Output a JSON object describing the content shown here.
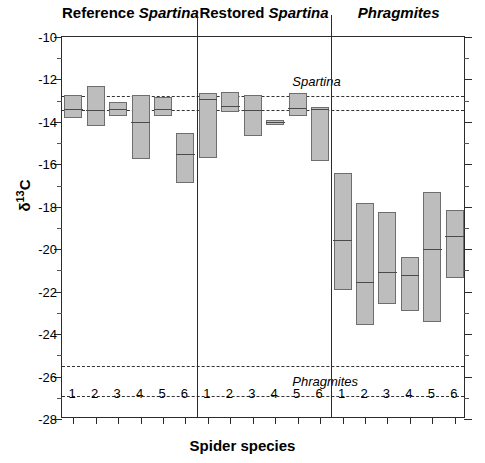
{
  "chart_data": {
    "type": "bar",
    "title": "",
    "xlabel": "Spider species",
    "ylabel_main": "δ13C",
    "ylabel_delta": "δ",
    "ylabel_sup": "13",
    "ylabel_element": "C",
    "ylim": [
      -28,
      -10
    ],
    "yticks": [
      -10,
      -12,
      -14,
      -16,
      -18,
      -20,
      -22,
      -24,
      -26,
      -28
    ],
    "ytick_labels": [
      "-10",
      "-12",
      "-14",
      "-16",
      "-18",
      "-20",
      "-22",
      "-24",
      "-26",
      "-28"
    ],
    "y_minor_step": 1,
    "grid": false,
    "legend": "none",
    "categories": [
      "1",
      "2",
      "3",
      "4",
      "5",
      "6"
    ],
    "bar_fill": "#bdbdbd",
    "bar_edge": "#6e6e6e",
    "median_color": "#4a4a4a",
    "axis_color": "#2b2b2b",
    "reference_lines": [
      {
        "name": "spartina-upper",
        "value": -12.8,
        "label": "Spartina",
        "label_shown": true,
        "label_x_pct": 57,
        "label_offset_y": -15
      },
      {
        "name": "spartina-lower",
        "value": -13.45,
        "label": "",
        "label_shown": false
      },
      {
        "name": "phragmites-upper",
        "value": -25.5,
        "label": "Phragmites",
        "label_shown": true,
        "label_x_pct": 57,
        "label_offset_y": 15
      },
      {
        "name": "phragmites-lower",
        "value": -26.9,
        "label": "",
        "label_shown": false
      }
    ],
    "groups": [
      {
        "name": "Reference Spartina",
        "label_plain": "Reference ",
        "label_italic": "Spartina",
        "bars": [
          {
            "species": "1",
            "top": -12.75,
            "bottom": -13.8,
            "median": -13.4
          },
          {
            "species": "2",
            "top": -12.3,
            "bottom": -14.2,
            "median": -13.45
          },
          {
            "species": "3",
            "top": -13.05,
            "bottom": -13.7,
            "median": -13.4
          },
          {
            "species": "4",
            "top": -12.75,
            "bottom": -15.75,
            "median": -14.0
          },
          {
            "species": "5",
            "top": -12.85,
            "bottom": -13.7,
            "median": -13.4
          },
          {
            "species": "6",
            "top": -14.5,
            "bottom": -16.9,
            "median": -15.55
          }
        ]
      },
      {
        "name": "Restored Spartina",
        "label_plain": "Restored ",
        "label_italic": "Spartina",
        "bars": [
          {
            "species": "1",
            "top": -12.65,
            "bottom": -15.7,
            "median": -12.95
          },
          {
            "species": "2",
            "top": -12.6,
            "bottom": -13.55,
            "median": -13.25
          },
          {
            "species": "3",
            "top": -12.75,
            "bottom": -14.65,
            "median": -13.45
          },
          {
            "species": "4",
            "top": -13.9,
            "bottom": -14.15,
            "median": -14.0
          },
          {
            "species": "5",
            "top": -12.65,
            "bottom": -13.7,
            "median": -13.35
          },
          {
            "species": "6",
            "top": -13.3,
            "bottom": -15.85,
            "median": -13.4
          }
        ]
      },
      {
        "name": "Phragmites",
        "label_plain": "",
        "label_italic": "Phragmites",
        "bars": [
          {
            "species": "1",
            "top": -16.4,
            "bottom": -21.9,
            "median": -19.6
          },
          {
            "species": "2",
            "top": -17.8,
            "bottom": -23.55,
            "median": -21.55
          },
          {
            "species": "3",
            "top": -18.25,
            "bottom": -22.6,
            "median": -21.1
          },
          {
            "species": "4",
            "top": -20.35,
            "bottom": -22.9,
            "median": -21.25
          },
          {
            "species": "5",
            "top": -17.3,
            "bottom": -23.45,
            "median": -20.0
          },
          {
            "species": "6",
            "top": -18.15,
            "bottom": -21.35,
            "median": -19.4
          }
        ]
      }
    ]
  }
}
